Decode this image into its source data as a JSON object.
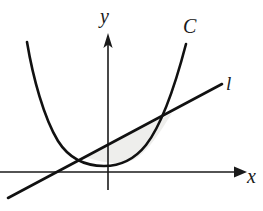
{
  "figure": {
    "background_color": "#ffffff",
    "ink_color": "#111111",
    "shade_color": "#eeeeec",
    "width": 263,
    "height": 211,
    "labels": {
      "y_axis": "y",
      "x_axis": "x",
      "curve": "C",
      "line": "l"
    },
    "axes": {
      "origin": {
        "x": 108,
        "y": 172
      },
      "x_axis": {
        "start_x": 0,
        "end_x": 245,
        "y": 172,
        "arrow": "right"
      },
      "y_axis": {
        "x": 108,
        "top_y": 34,
        "bottom_y": 190,
        "arrow": "up"
      }
    },
    "curve": {
      "type": "convex-upward",
      "left_end": {
        "x": 27,
        "y": 42
      },
      "minimum": {
        "x": 126,
        "y": 164
      },
      "right_end": {
        "x": 186,
        "y": 44
      }
    },
    "line": {
      "type": "straight-increasing",
      "lower_left_end": {
        "x": 8,
        "y": 198
      },
      "upper_right_end": {
        "x": 222,
        "y": 84
      },
      "x_intercept": {
        "x": 58,
        "y": 172
      }
    },
    "intersections": [
      {
        "name": "left-intersection",
        "x": 85,
        "y": 157
      },
      {
        "name": "right-intersection",
        "x": 172,
        "y": 113
      }
    ],
    "shaded_region": {
      "bounded_above_by": "line l",
      "bounded_below_by": "curve C",
      "between_intersections": true
    }
  }
}
